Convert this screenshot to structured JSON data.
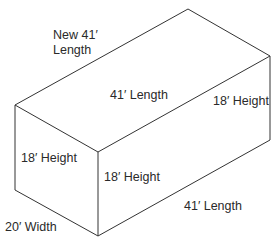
{
  "diagram": {
    "type": "isometric-box",
    "stroke_color": "#333333",
    "text_color": "#2a2a2a",
    "vertices": {
      "top_left": [
        15,
        105
      ],
      "top_back": [
        188,
        9
      ],
      "top_right": [
        270,
        56
      ],
      "front_top": [
        98,
        152
      ],
      "left_bottom": [
        15,
        190
      ],
      "front_bottom": [
        98,
        236
      ],
      "right_bottom": [
        270,
        140
      ]
    },
    "labels": {
      "new_length_line1": "New 41′",
      "new_length_line2": "Length",
      "top_length": "41′ Length",
      "right_height": "18′ Height",
      "left_height": "18′ Height",
      "front_height": "18′ Height",
      "bottom_length": "41′ Length",
      "width": "20′ Width"
    }
  }
}
